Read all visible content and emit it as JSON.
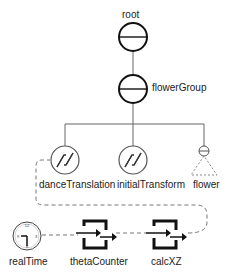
{
  "diagram": {
    "type": "scene-graph",
    "nodes": {
      "root": {
        "label": "root",
        "kind": "group"
      },
      "flowerGroup": {
        "label": "flowerGroup",
        "kind": "group"
      },
      "danceTranslation": {
        "label": "danceTranslation",
        "kind": "transform"
      },
      "initialTransform": {
        "label": "initialTransform",
        "kind": "transform"
      },
      "flower": {
        "label": "flower",
        "kind": "separator-subgraph"
      },
      "realTime": {
        "label": "realTime",
        "kind": "global-field-clock"
      },
      "thetaCounter": {
        "label": "thetaCounter",
        "kind": "engine"
      },
      "calcXZ": {
        "label": "calcXZ",
        "kind": "engine"
      }
    },
    "edges": [
      {
        "from": "root",
        "to": "flowerGroup",
        "style": "solid"
      },
      {
        "from": "flowerGroup",
        "to": "danceTranslation",
        "style": "solid"
      },
      {
        "from": "flowerGroup",
        "to": "initialTransform",
        "style": "solid"
      },
      {
        "from": "flowerGroup",
        "to": "flower",
        "style": "solid"
      },
      {
        "from": "realTime",
        "to": "thetaCounter",
        "style": "dashed"
      },
      {
        "from": "thetaCounter",
        "to": "calcXZ",
        "style": "dashed"
      },
      {
        "from": "calcXZ",
        "to": "danceTranslation",
        "style": "dashed"
      }
    ]
  }
}
